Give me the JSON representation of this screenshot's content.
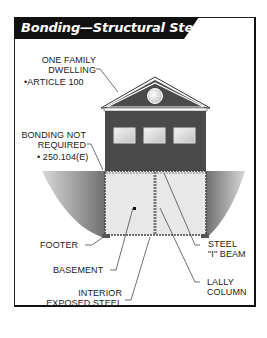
{
  "title": "Bonding—Structural Steel",
  "labels": {
    "dwelling_line1": "ONE FAMILY",
    "dwelling_line2": "DWELLING",
    "dwelling_ref": "•ARTICLE 100",
    "bonding_line1": "BONDING NOT",
    "bonding_line2": "REQUIRED",
    "bonding_ref": "• 250.104(E)",
    "footer": "FOOTER",
    "basement": "BASEMENT",
    "interior_line1": "INTERIOR",
    "interior_line2": "EXPOSED STEEL",
    "steel_line1": "STEEL",
    "steel_line2": "\"I\" BEAM",
    "lally_line1": "LALLY",
    "lally_line2": "COLUMN"
  },
  "colors": {
    "title_bg": "#111111",
    "house_wall": "#4a4a4a",
    "ground": "#8c8c8c",
    "basement_fill": "#e6e6e6"
  }
}
